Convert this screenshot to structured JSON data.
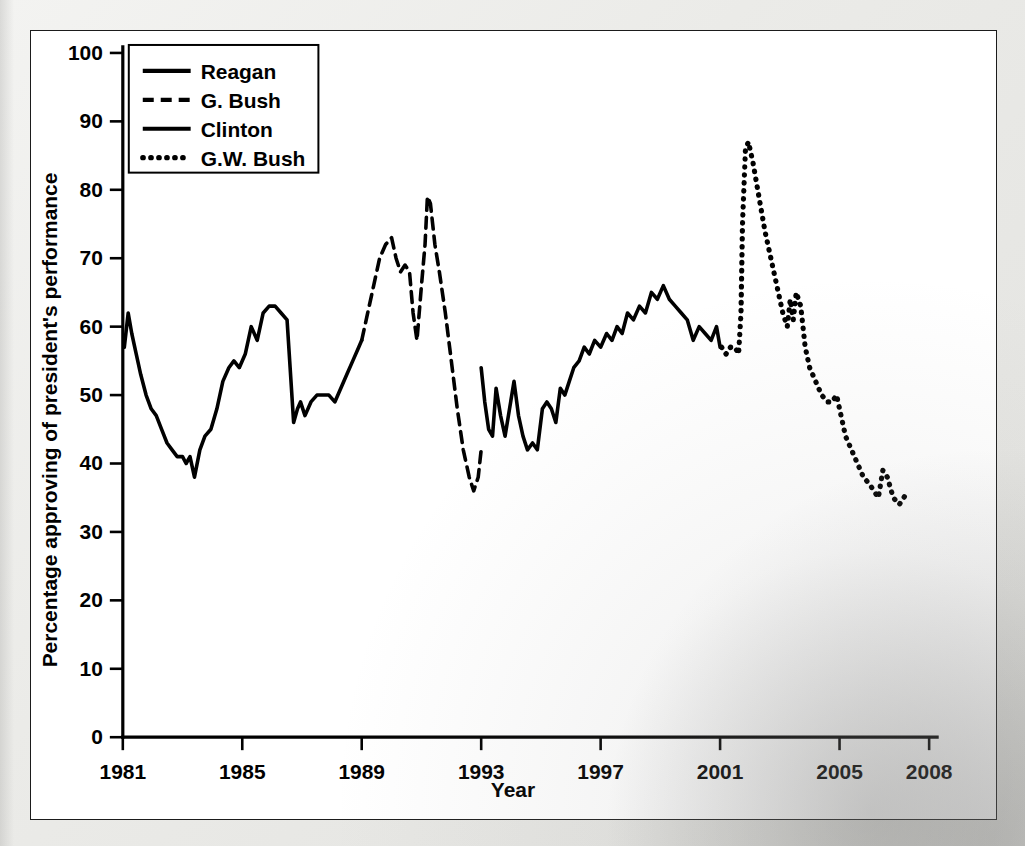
{
  "figure": {
    "background_color": "#ffffff",
    "border_color": "#1b1b1b",
    "ink_color": "#000000"
  },
  "chart_data": {
    "type": "line",
    "title": "",
    "xlabel": "Year",
    "ylabel": "Percentage approving of president's performance",
    "xlim": [
      1981,
      2008
    ],
    "ylim": [
      0,
      100
    ],
    "grid": false,
    "legend_position": "top-left",
    "xticks": [
      1981,
      1985,
      1989,
      1993,
      1997,
      2001,
      2005,
      2008
    ],
    "xtick_labels": [
      "1981",
      "1985",
      "1989",
      "1993",
      "1997",
      "2001",
      "2005",
      "2008"
    ],
    "yticks": [
      0,
      10,
      20,
      30,
      40,
      50,
      60,
      70,
      80,
      90,
      100
    ],
    "ytick_labels": [
      "0",
      "10",
      "20",
      "30",
      "40",
      "50",
      "60",
      "70",
      "80",
      "90",
      "100"
    ],
    "series": [
      {
        "name": "Reagan",
        "line_style": "solid",
        "x": [
          1981.05,
          1981.18,
          1981.3,
          1981.45,
          1981.6,
          1981.78,
          1981.95,
          1982.12,
          1982.3,
          1982.48,
          1982.65,
          1982.82,
          1983.0,
          1983.12,
          1983.25,
          1983.4,
          1983.58,
          1983.75,
          1983.95,
          1984.15,
          1984.35,
          1984.55,
          1984.72,
          1984.9,
          1985.1,
          1985.3,
          1985.5,
          1985.7,
          1985.9,
          1986.1,
          1986.3,
          1986.5,
          1986.72,
          1986.85,
          1986.95,
          1987.1,
          1987.3,
          1987.5,
          1987.7,
          1987.9,
          1988.1,
          1988.3,
          1988.5,
          1988.7,
          1988.9,
          1989.0
        ],
        "y": [
          57,
          62,
          59,
          56,
          53,
          50,
          48,
          47,
          45,
          43,
          42,
          41,
          41,
          40,
          41,
          38,
          42,
          44,
          45,
          48,
          52,
          54,
          55,
          54,
          56,
          60,
          58,
          62,
          63,
          63,
          62,
          61,
          46,
          48,
          49,
          47,
          49,
          50,
          50,
          50,
          49,
          51,
          53,
          55,
          57,
          58
        ],
        "color": "#000000"
      },
      {
        "name": "G. Bush",
        "line_style": "dashed",
        "x": [
          1989.0,
          1989.2,
          1989.4,
          1989.6,
          1989.8,
          1990.0,
          1990.15,
          1990.3,
          1990.45,
          1990.6,
          1990.72,
          1990.85,
          1991.0,
          1991.12,
          1991.2,
          1991.3,
          1991.45,
          1991.6,
          1991.8,
          1992.0,
          1992.2,
          1992.4,
          1992.6,
          1992.75,
          1992.9,
          1993.0
        ],
        "y": [
          58,
          62,
          66,
          70,
          72,
          73,
          70,
          68,
          69,
          68,
          62,
          58,
          66,
          72,
          79,
          78,
          72,
          68,
          62,
          55,
          48,
          42,
          38,
          36,
          38,
          42
        ],
        "color": "#000000"
      },
      {
        "name": "Clinton",
        "line_style": "solid",
        "x": [
          1993.0,
          1993.12,
          1993.25,
          1993.38,
          1993.5,
          1993.65,
          1993.8,
          1993.95,
          1994.1,
          1994.25,
          1994.4,
          1994.55,
          1994.72,
          1994.88,
          1995.05,
          1995.2,
          1995.35,
          1995.5,
          1995.65,
          1995.8,
          1995.95,
          1996.1,
          1996.28,
          1996.45,
          1996.62,
          1996.8,
          1997.0,
          1997.2,
          1997.38,
          1997.55,
          1997.72,
          1997.9,
          1998.1,
          1998.3,
          1998.5,
          1998.7,
          1998.9,
          1999.1,
          1999.3,
          1999.5,
          1999.7,
          1999.9,
          2000.1,
          2000.3,
          2000.5,
          2000.7,
          2000.88,
          2001.0
        ],
        "y": [
          54,
          49,
          45,
          44,
          51,
          47,
          44,
          48,
          52,
          47,
          44,
          42,
          43,
          42,
          48,
          49,
          48,
          46,
          51,
          50,
          52,
          54,
          55,
          57,
          56,
          58,
          57,
          59,
          58,
          60,
          59,
          62,
          61,
          63,
          62,
          65,
          64,
          66,
          64,
          63,
          62,
          61,
          58,
          60,
          59,
          58,
          60,
          57
        ],
        "color": "#000000"
      },
      {
        "name": "G.W. Bush",
        "line_style": "dotted",
        "x": [
          2001.05,
          2001.2,
          2001.35,
          2001.5,
          2001.62,
          2001.7,
          2001.75,
          2001.85,
          2001.95,
          2002.1,
          2002.3,
          2002.5,
          2002.7,
          2002.9,
          2003.1,
          2003.25,
          2003.35,
          2003.45,
          2003.55,
          2003.7,
          2003.85,
          2004.0,
          2004.2,
          2004.4,
          2004.6,
          2004.75,
          2004.9,
          2005.05,
          2005.2,
          2005.4,
          2005.6,
          2005.8,
          2006.0,
          2006.15,
          2006.3,
          2006.45,
          2006.6,
          2006.8,
          2007.0,
          2007.15,
          2007.3
        ],
        "y": [
          57,
          56,
          57,
          57,
          56,
          62,
          75,
          86,
          87,
          84,
          79,
          74,
          70,
          66,
          62,
          60,
          64,
          61,
          65,
          63,
          57,
          54,
          52,
          50,
          49,
          49,
          50,
          47,
          44,
          42,
          40,
          38,
          37,
          36,
          35,
          39,
          38,
          35,
          34,
          35,
          36
        ],
        "color": "#000000"
      }
    ]
  },
  "legend": {
    "entries": [
      {
        "label": "Reagan",
        "style": "solid"
      },
      {
        "label": "G. Bush",
        "style": "dashed"
      },
      {
        "label": "Clinton",
        "style": "solid"
      },
      {
        "label": "G.W. Bush",
        "style": "dotted"
      }
    ]
  },
  "axes": {
    "x_title": "Year",
    "y_title": "Percentage approving of president's performance"
  }
}
